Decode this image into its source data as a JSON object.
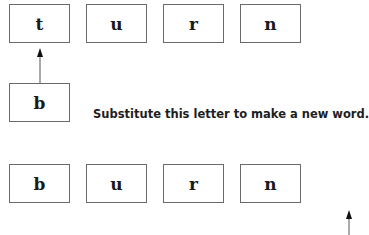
{
  "original_word": [
    "t",
    "u",
    "r",
    "n"
  ],
  "substitute_letter": "b",
  "instruction": "Substitute this letter to make a new word.",
  "new_word": [
    "b",
    "u",
    "r",
    "n"
  ],
  "icons": {
    "up_arrow": "arrow-up-icon"
  }
}
